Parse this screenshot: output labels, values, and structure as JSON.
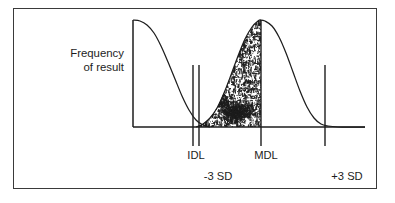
{
  "figure": {
    "kind": "frequency-distribution-diagram",
    "border_color": "#3a3a3a",
    "background": "#ffffff",
    "ink_color": "#1d1d1d"
  },
  "axis": {
    "y_label_line1": "Frequency",
    "y_label_line2": "of result",
    "x_axis_label": "",
    "grid": false
  },
  "markers": [
    {
      "id": "idl-left",
      "label": "",
      "x": 193
    },
    {
      "id": "idl-right",
      "label": "IDL",
      "x": 199
    },
    {
      "id": "mdl",
      "label": "MDL",
      "x": 261
    },
    {
      "id": "plus3sd",
      "label": "",
      "x": 325
    }
  ],
  "sd_labels": [
    {
      "id": "minus-3-sd",
      "label": "-3 SD",
      "x": 218
    },
    {
      "id": "plus-3-sd",
      "label": "+3 SD",
      "x": 347
    }
  ],
  "tick_labels": {
    "idl": "IDL",
    "mdl": "MDL",
    "minus_3_sd": "-3 SD",
    "plus_3_sd": "+3 SD"
  },
  "chart_data": {
    "type": "area",
    "title": "",
    "xlabel": "",
    "ylabel": "Frequency of result",
    "grid": false,
    "legend": null,
    "xlim": [
      133,
      365
    ],
    "ylim": [
      127,
      20
    ],
    "axis_pixels": {
      "y_axis_x": 133,
      "x_axis_y": 127,
      "x_axis_x_start": 133,
      "x_axis_x_end": 365,
      "plot_top_y": 20
    },
    "series": [
      {
        "name": "blank / background distribution tail",
        "note": "descending right tail of a distribution centered left of the y-axis",
        "points": [
          [
            133,
            20
          ],
          [
            140,
            21
          ],
          [
            147,
            25
          ],
          [
            154,
            33
          ],
          [
            161,
            46
          ],
          [
            168,
            62
          ],
          [
            175,
            79
          ],
          [
            182,
            96
          ],
          [
            189,
            110
          ],
          [
            196,
            120
          ],
          [
            203,
            125
          ],
          [
            210,
            127
          ]
        ]
      },
      {
        "name": "sample distribution (bell curve)",
        "note": "gaussian peaking at the MDL line",
        "peak_x": 261,
        "peak_y": 20,
        "points": [
          [
            196,
            127
          ],
          [
            203,
            124
          ],
          [
            210,
            118
          ],
          [
            217,
            108
          ],
          [
            224,
            93
          ],
          [
            231,
            75
          ],
          [
            238,
            56
          ],
          [
            245,
            39
          ],
          [
            252,
            27
          ],
          [
            258,
            21
          ],
          [
            261,
            20
          ],
          [
            265,
            21
          ],
          [
            272,
            26
          ],
          [
            279,
            37
          ],
          [
            286,
            53
          ],
          [
            293,
            72
          ],
          [
            300,
            91
          ],
          [
            307,
            107
          ],
          [
            314,
            118
          ],
          [
            321,
            124
          ],
          [
            328,
            126
          ],
          [
            338,
            127
          ],
          [
            350,
            127
          ],
          [
            365,
            127
          ]
        ]
      }
    ],
    "shaded_region": {
      "name": "stippled area under bell curve left of MDL",
      "fill_style": "random-stipple",
      "x_from": 196,
      "x_to": 261,
      "baseline_y": 127
    },
    "annotations": [
      {
        "text": "IDL",
        "x": 196,
        "y": 155
      },
      {
        "text": "MDL",
        "x": 266,
        "y": 155
      },
      {
        "text": "-3 SD",
        "x": 218,
        "y": 176
      },
      {
        "text": "+3 SD",
        "x": 347,
        "y": 176
      }
    ]
  }
}
